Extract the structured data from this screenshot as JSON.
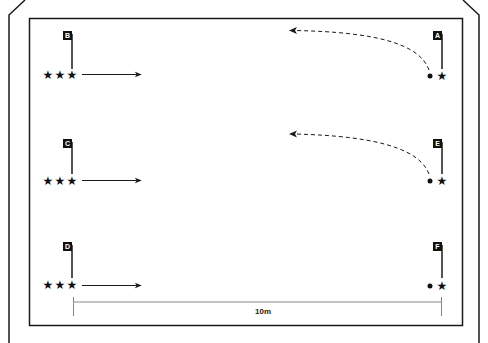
{
  "diagram": {
    "colors": {
      "line": "#1a1a1a",
      "background": "#ffffff",
      "scale_line": "#888888"
    },
    "scale": {
      "label": "10m"
    },
    "flags": [
      {
        "id": "A",
        "label": "A",
        "side": "right",
        "row": 1
      },
      {
        "id": "B",
        "label": "B",
        "side": "left",
        "row": 1
      },
      {
        "id": "C",
        "label": "C",
        "side": "left",
        "row": 2
      },
      {
        "id": "D",
        "label": "D",
        "side": "left",
        "row": 3
      },
      {
        "id": "E",
        "label": "E",
        "side": "right",
        "row": 2
      },
      {
        "id": "F",
        "label": "F",
        "side": "right",
        "row": 3
      }
    ],
    "stations": {
      "left": {
        "player_glyph": "★",
        "players_per_station": 3,
        "arrow": "solid-right"
      },
      "right": {
        "player_glyph": "★",
        "ball_glyph": "●",
        "arrow": "dashed-curved-left"
      }
    },
    "legend_glyphs": {
      "player": "star-icon",
      "ball": "ball-icon",
      "pass_run": "dashed-arrow",
      "dribble_run": "solid-arrow"
    }
  }
}
